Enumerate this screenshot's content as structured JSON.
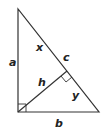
{
  "diagram": {
    "type": "right-triangle-altitude",
    "stroke_color": "#333333",
    "labels": {
      "a": "a",
      "b": "b",
      "c": "c",
      "x": "x",
      "y": "y",
      "h": "h"
    }
  }
}
